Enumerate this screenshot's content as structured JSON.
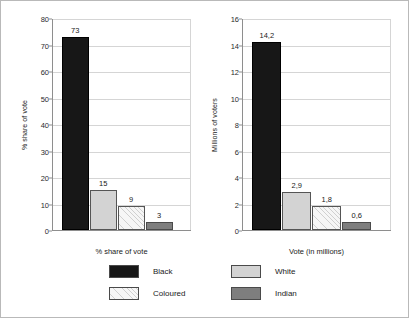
{
  "chart_data": [
    {
      "type": "bar",
      "panel": "left",
      "title": "",
      "xlabel": "% share of vote",
      "ylabel": "% share of vote",
      "categories": [
        "Black",
        "White",
        "Coloured",
        "Indian"
      ],
      "values": [
        73,
        15,
        9,
        3
      ],
      "value_labels": [
        "73",
        "15",
        "9",
        "3"
      ],
      "ylim": [
        0,
        80
      ],
      "ytick_step": 10,
      "yticks": [
        "0",
        "10",
        "20",
        "30",
        "40",
        "50",
        "60",
        "70",
        "80"
      ],
      "grid": "horizontal",
      "legend_position": "bottom"
    },
    {
      "type": "bar",
      "panel": "right",
      "title": "",
      "xlabel": "Vote (in millions)",
      "ylabel": "Millions of voters",
      "categories": [
        "Black",
        "White",
        "Coloured",
        "Indian"
      ],
      "values": [
        14.2,
        2.9,
        1.8,
        0.6
      ],
      "value_labels": [
        "14,2",
        "2,9",
        "1,8",
        "0,6"
      ],
      "ylim": [
        0,
        16
      ],
      "ytick_step": 2,
      "yticks": [
        "0",
        "2",
        "4",
        "6",
        "8",
        "10",
        "12",
        "14",
        "16"
      ],
      "grid": "horizontal",
      "legend_position": "bottom"
    }
  ],
  "legend": {
    "items": [
      {
        "label": "Black",
        "color": "#171717",
        "style": "solid"
      },
      {
        "label": "White",
        "color": "#d3d3d3",
        "style": "solid"
      },
      {
        "label": "Coloured",
        "color": "#f3f3f3",
        "style": "hatch"
      },
      {
        "label": "Indian",
        "color": "#7e7e7e",
        "style": "solid"
      }
    ]
  },
  "colors": {
    "black": "#171717",
    "white": "#d3d3d3",
    "coloured": "#f3f3f3",
    "indian": "#7e7e7e",
    "gridline": "#d5d5d5",
    "axis": "#8e8e8e",
    "border": "#b9b9b9"
  }
}
